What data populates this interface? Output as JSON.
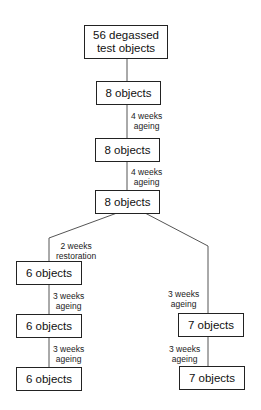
{
  "diagram": {
    "type": "flowchart",
    "nodes": [
      {
        "id": "start",
        "label": "56 degassed test objects"
      },
      {
        "id": "n1",
        "label": "8 objects"
      },
      {
        "id": "n2",
        "label": "8 objects"
      },
      {
        "id": "n3",
        "label": "8 objects"
      },
      {
        "id": "l1",
        "label": "6 objects"
      },
      {
        "id": "l2",
        "label": "6 objects"
      },
      {
        "id": "l3",
        "label": "6 objects"
      },
      {
        "id": "r1",
        "label": "7 objects"
      },
      {
        "id": "r2",
        "label": "7 objects"
      }
    ],
    "edges": [
      {
        "from": "start",
        "to": "n1",
        "label": ""
      },
      {
        "from": "n1",
        "to": "n2",
        "label_line1": "4 weeks",
        "label_line2": "ageing"
      },
      {
        "from": "n2",
        "to": "n3",
        "label_line1": "4 weeks",
        "label_line2": "ageing"
      },
      {
        "from": "n3",
        "to": "l1",
        "label_line1": "2 weeks",
        "label_line2": "restoration"
      },
      {
        "from": "l1",
        "to": "l2",
        "label_line1": "3 weeks",
        "label_line2": "ageing"
      },
      {
        "from": "l2",
        "to": "l3",
        "label_line1": "3 weeks",
        "label_line2": "ageing"
      },
      {
        "from": "n3",
        "to": "r1",
        "label_line1": "3 weeks",
        "label_line2": "ageing"
      },
      {
        "from": "r1",
        "to": "r2",
        "label_line1": "3 weeks",
        "label_line2": "ageing"
      }
    ],
    "start_line1": "56 degassed",
    "start_line2": "test objects"
  }
}
